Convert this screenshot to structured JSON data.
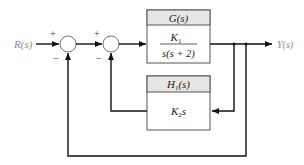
{
  "diagram": {
    "type": "block-diagram",
    "input": {
      "label": "R(s)"
    },
    "output": {
      "label": "Y(s)"
    },
    "summing_junctions": [
      {
        "id": "sum1",
        "plus_sign": "+",
        "minus_sign": "−"
      },
      {
        "id": "sum2",
        "plus_sign": "+",
        "minus_sign": "−"
      }
    ],
    "blocks": {
      "forward": {
        "title": "G(s)",
        "numerator": "K",
        "numerator_sub": "1",
        "denominator": "s(s + 2)"
      },
      "feedback": {
        "title_main": "H",
        "title_sub": "1",
        "title_tail": "(s)",
        "body_main": "K",
        "body_sub": "2",
        "body_tail": "s"
      }
    },
    "colors": {
      "line": "#111111",
      "header_fill": "#e6e6e6",
      "label_gray": "#8a8a8a"
    }
  }
}
